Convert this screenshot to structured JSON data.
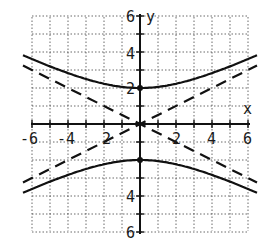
{
  "chart_data": {
    "type": "line",
    "title": "",
    "xlabel": "x",
    "ylabel": "y",
    "xlim": [
      -6,
      6
    ],
    "ylim": [
      -6,
      6
    ],
    "grid": true,
    "x_ticks": [
      -6,
      -4,
      -2,
      2,
      4,
      6
    ],
    "y_ticks": [
      -6,
      -4,
      -2,
      2,
      4,
      6
    ],
    "x_tick_labels": [
      "-6",
      "-4",
      "2",
      "2",
      "4",
      "6"
    ],
    "y_tick_labels": [
      "6",
      "4",
      "2",
      "4",
      "6"
    ],
    "series": [
      {
        "name": "hyperbola upper branch",
        "style": "solid",
        "equation": "y = 2*sqrt(1 + x^2/16)",
        "x": [
          -6.5,
          -6,
          -4,
          -2,
          0,
          2,
          4,
          6,
          6.5
        ],
        "y": [
          3.82,
          3.61,
          2.83,
          2.24,
          2.0,
          2.24,
          2.83,
          3.61,
          3.82
        ]
      },
      {
        "name": "hyperbola lower branch",
        "style": "solid",
        "equation": "y = -2*sqrt(1 + x^2/16)",
        "x": [
          -6.5,
          -6,
          -4,
          -2,
          0,
          2,
          4,
          6,
          6.5
        ],
        "y": [
          -3.82,
          -3.61,
          -2.83,
          -2.24,
          -2.0,
          -2.24,
          -2.83,
          -3.61,
          -3.82
        ]
      },
      {
        "name": "asymptote y = x/2",
        "style": "dashed",
        "x": [
          -6.5,
          6.5
        ],
        "y": [
          -3.25,
          3.25
        ]
      },
      {
        "name": "asymptote y = -x/2",
        "style": "dashed",
        "x": [
          -6.5,
          6.5
        ],
        "y": [
          3.25,
          -3.25
        ]
      }
    ],
    "points": [
      {
        "label": "vertex",
        "x": 0,
        "y": 2
      },
      {
        "label": "vertex",
        "x": 0,
        "y": -2
      }
    ]
  },
  "labels": {
    "x_axis": "x",
    "y_axis": "y",
    "x_neg6": "-6",
    "x_neg4": "-4",
    "x_neg2": "2",
    "x_pos2": "2",
    "x_pos4": "4",
    "x_pos6": "6",
    "y_pos6": "6",
    "y_pos4": "4",
    "y_pos2": "2",
    "y_neg4": "4",
    "y_neg6": "6"
  }
}
